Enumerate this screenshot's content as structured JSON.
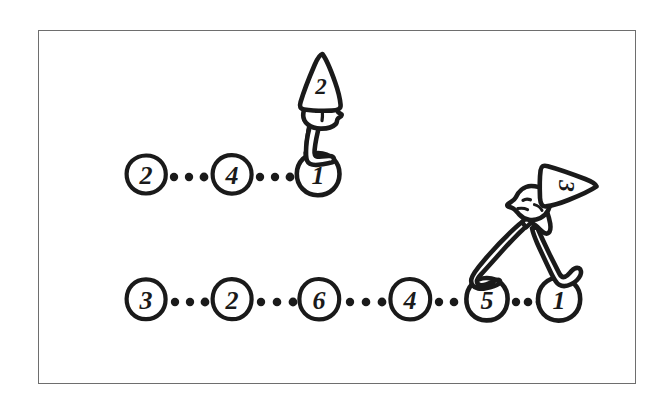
{
  "figure": {
    "background_color": "#ffffff",
    "ink_color": "#1a1a1a",
    "frame_color": "#6e6e6e",
    "frame": {
      "x": 38,
      "y": 30,
      "width": 598,
      "height": 354
    }
  },
  "chains": [
    {
      "id": "upper-chain",
      "name": "upper-node-chain",
      "y": 174,
      "separator": "...",
      "separator_dots": 3,
      "nodes": [
        {
          "label": "2",
          "cx": 146,
          "cy": 174,
          "rx": 19,
          "ry": 19
        },
        {
          "label": "4",
          "cx": 232,
          "cy": 174,
          "rx": 19,
          "ry": 19
        },
        {
          "label": "1",
          "cx": 318,
          "cy": 174,
          "rx": 21,
          "ry": 21
        }
      ],
      "dot_groups": [
        {
          "cx": [
            174,
            189,
            204
          ],
          "cy": 177
        },
        {
          "cx": [
            260,
            275,
            290
          ],
          "cy": 177
        }
      ]
    },
    {
      "id": "lower-chain",
      "name": "lower-node-chain",
      "y": 299,
      "separator": "...",
      "separator_dots": 3,
      "nodes": [
        {
          "label": "3",
          "cx": 146,
          "cy": 299,
          "rx": 19,
          "ry": 20
        },
        {
          "label": "2",
          "cx": 232,
          "cy": 299,
          "rx": 19,
          "ry": 20
        },
        {
          "label": "6",
          "cx": 319,
          "cy": 299,
          "rx": 20,
          "ry": 20
        },
        {
          "label": "4",
          "cx": 410,
          "cy": 299,
          "rx": 20,
          "ry": 20
        },
        {
          "label": "5",
          "cx": 487,
          "cy": 299,
          "rx": 20,
          "ry": 21
        },
        {
          "label": "1",
          "cx": 559,
          "cy": 299,
          "rx": 21,
          "ry": 21
        }
      ],
      "dot_groups": [
        {
          "cx": [
            175,
            190,
            205
          ],
          "cy": 302
        },
        {
          "cx": [
            261,
            277,
            293
          ],
          "cy": 302
        },
        {
          "cx": [
            350,
            366,
            382
          ],
          "cy": 302
        },
        {
          "cx": [
            439,
            454,
            469
          ],
          "cy": 302
        },
        {
          "cx": [
            516,
            528,
            540
          ],
          "cy": 302
        }
      ]
    }
  ],
  "characters": [
    {
      "id": "standing-figure",
      "name": "standing-gnome-figure",
      "pose": "upright",
      "hat_label": "2",
      "hat_rotation_deg": 0,
      "stands_on": [
        "1"
      ],
      "head_cx": 320,
      "head_cy": 114,
      "hat_apex_y": 53
    },
    {
      "id": "striding-figure",
      "name": "striding-gnome-figure",
      "pose": "legs-apart-stride",
      "hat_label": "3",
      "hat_rotation_deg": 90,
      "stands_on": [
        "5",
        "1"
      ],
      "head_cx": 528,
      "head_cy": 207,
      "hat_apex_x": 596
    }
  ]
}
